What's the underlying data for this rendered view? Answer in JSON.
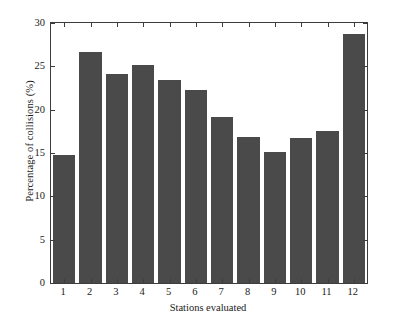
{
  "chart_data": {
    "type": "bar",
    "title": "",
    "xlabel": "Stations evaluated",
    "ylabel": "Percentage of collisions (%)",
    "categories": [
      "1",
      "2",
      "3",
      "4",
      "5",
      "6",
      "7",
      "8",
      "9",
      "10",
      "11",
      "12"
    ],
    "values": [
      14.8,
      26.6,
      24.1,
      25.1,
      23.4,
      22.3,
      19.2,
      16.9,
      15.1,
      16.7,
      17.5,
      28.7
    ],
    "ylim": [
      0,
      30
    ],
    "yticks": [
      0,
      5,
      10,
      15,
      20,
      25,
      30
    ],
    "ytick_labels": [
      "0",
      "5",
      "10",
      "15",
      "20",
      "25",
      "30"
    ],
    "grid": false,
    "legend": null,
    "bar_color": "#4a4a4a",
    "axis_color": "#3c3c3c",
    "background": "#ffffff"
  }
}
